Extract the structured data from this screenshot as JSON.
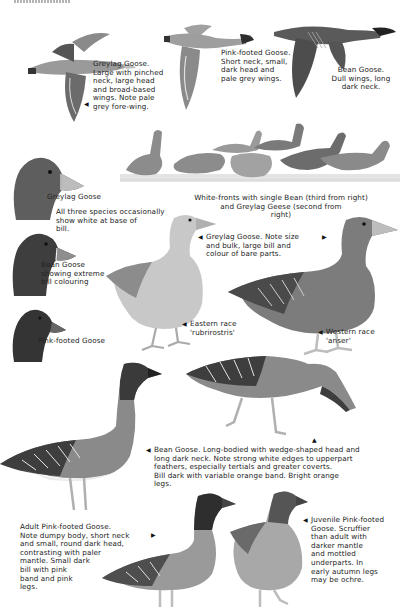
{
  "page": {
    "type": "field-guide-plate",
    "header_fragment": "…"
  },
  "flight": {
    "greylag": "Greylag Goose.\nLarge with pinched\nneck, large head\nand broad-based\nwings. Note pale\ngrey fore-wing.",
    "pinkfooted": "Pink-footed Goose.\nShort neck, small,\ndark head and\npale grey wings.",
    "bean": "Bean Goose.\nDull wings, long\ndark neck."
  },
  "heads": {
    "greylag": "Greylag Goose",
    "note": "All three species occasionally\nshow white at base of\nbill.",
    "bean": "Bean Goose\nshowing extreme\nbill colouring",
    "pinkfooted": "Pink-footed Goose"
  },
  "flock": {
    "caption": "White-fronts with single Bean (third from right)\nand Greylag Geese (second from\nright)"
  },
  "greylag_standing": {
    "caption": "Greylag Goose. Note size\nand bulk, large bill and\ncolour of bare parts.",
    "eastern": "Eastern race\n'rubrirostris'",
    "western": "Western race\n'anser'"
  },
  "bean_standing": {
    "caption": "Bean Goose. Long-bodied with wedge-shaped head and\nlong dark neck. Note strong white edges to upperpart\nfeathers, especially tertials and greater coverts.\nBill dark with variable orange band. Bright orange\nlegs."
  },
  "pinkfooted_standing": {
    "adult": "Adult Pink-footed Goose.\nNote dumpy body, short neck\nand small, round dark head,\ncontrasting with paler\nmantle. Small dark\nbill with pink\nband and pink\nlegs.",
    "juvenile": "Juvenile Pink-footed\nGoose. Scruffier\nthan adult with\ndarker mantle\nand mottled\nunderparts. In\nearly autumn legs\nmay be ochre."
  },
  "colors": {
    "ink": "#1a1a1a",
    "dark_plumage": "#3c3c3c",
    "mid_plumage": "#7d7d7d",
    "light_plumage": "#c4c4c4",
    "belly": "#e6e6e6",
    "leg": "#b8b8b8"
  }
}
